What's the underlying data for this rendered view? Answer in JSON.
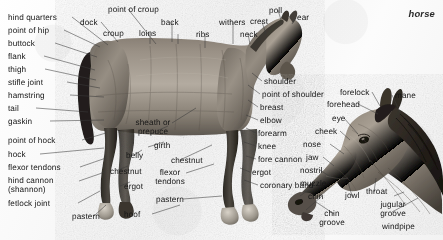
{
  "figure": {
    "title": "horse",
    "background_color": "#fafafa",
    "text_color": "#161616",
    "leader_line_color": "#3a3a3a"
  },
  "labels": {
    "hind_quarters": "hind quarters",
    "point_of_hip": "point of hip",
    "buttock": "buttock",
    "flank": "flank",
    "thigh": "thigh",
    "stifle_joint": "stifle joint",
    "hamstring": "hamstring",
    "tail": "tail",
    "gaskin": "gaskin",
    "point_of_hock": "point of hock",
    "hock": "hock",
    "flexor_tendons_hind": "flexor tendons",
    "hind_cannon": "hind cannon\n(shannon)",
    "fetlock_joint": "fetlock joint",
    "pastern_hind": "pastern",
    "dock": "dock",
    "croup": "croup",
    "point_of_croup": "point of croup",
    "loins": "loins",
    "back": "back",
    "ribs": "ribs",
    "withers": "withers",
    "neck": "neck",
    "crest": "crest",
    "poll": "poll",
    "ear": "ear",
    "sheath_or_prepuce": "sheath or\nprepuce",
    "belly": "belly",
    "chestnut_hind": "chestnut",
    "ergot_hind": "ergot",
    "hoof": "hoof",
    "girth": "girth",
    "chestnut_fore": "chestnut",
    "flexor_tendons_fore": "flexor\ntendons",
    "pastern_fore": "pastern",
    "shoulder": "shoulder",
    "point_of_shoulder": "point of shoulder",
    "breast": "breast",
    "elbow": "elbow",
    "forearm": "forearm",
    "knee": "knee",
    "fore_cannon": "fore cannon",
    "ergot_fore": "ergot",
    "coronary_band": "coronary band",
    "forelock": "forelock",
    "mane": "mane",
    "forehead": "forehead",
    "eye": "eye",
    "cheek": "cheek",
    "nose": "nose",
    "jaw": "jaw",
    "nostril": "nostril",
    "muzzle": "muzzle",
    "chin": "chin",
    "jowl": "jowl",
    "throat": "throat",
    "jugular_groove": "jugular\ngroove",
    "chin_groove": "chin\ngroove",
    "windpipe": "windpipe"
  }
}
